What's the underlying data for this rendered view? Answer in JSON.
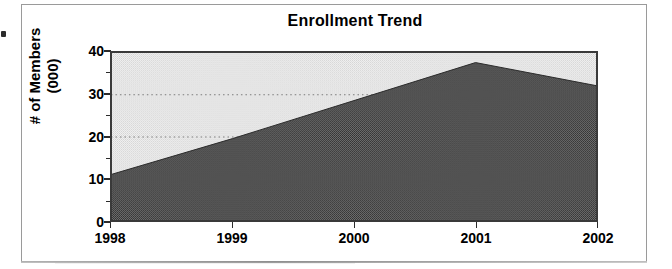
{
  "figure": {
    "frame_border_color": "#9a9a9a",
    "background": "#ffffff",
    "artifact_speck": "scan-speck"
  },
  "chart_data": {
    "type": "area",
    "title": "Enrollment Trend",
    "xlabel": "",
    "ylabel": "# of Members (000)",
    "ylabel_line1": "# of Members",
    "ylabel_line2": "(000)",
    "categories": [
      "1998",
      "1999",
      "2000",
      "2001",
      "2002"
    ],
    "x": [
      1998,
      1999,
      2000,
      2001,
      2002
    ],
    "values": [
      11,
      19.5,
      28.5,
      37.5,
      32
    ],
    "series": [
      {
        "name": "Enrollment",
        "values": [
          11,
          19.5,
          28.5,
          37.5,
          32
        ]
      }
    ],
    "ylim": [
      0,
      40
    ],
    "xlim": [
      1998,
      2002
    ],
    "y_ticks": [
      0,
      10,
      20,
      30,
      40
    ],
    "y_tick_labels": [
      "0",
      "10",
      "20",
      "30",
      "40"
    ],
    "y_minor_ticks": [
      5,
      15,
      25,
      35
    ],
    "x_ticks": [
      1998,
      1999,
      2000,
      2001,
      2002
    ],
    "grid": true,
    "gridlines_at": [
      20,
      30
    ],
    "legend": null,
    "legend_position": "none",
    "fill_color": "#585858",
    "plot_background": "#ededed",
    "axis_color": "#3a3a3a",
    "units": "thousands of members"
  },
  "y_axis": {
    "labels": [
      "40",
      "30",
      "20",
      "10",
      "0"
    ]
  },
  "x_axis": {
    "labels": [
      "1998",
      "1999",
      "2000",
      "2001",
      "2002"
    ]
  }
}
